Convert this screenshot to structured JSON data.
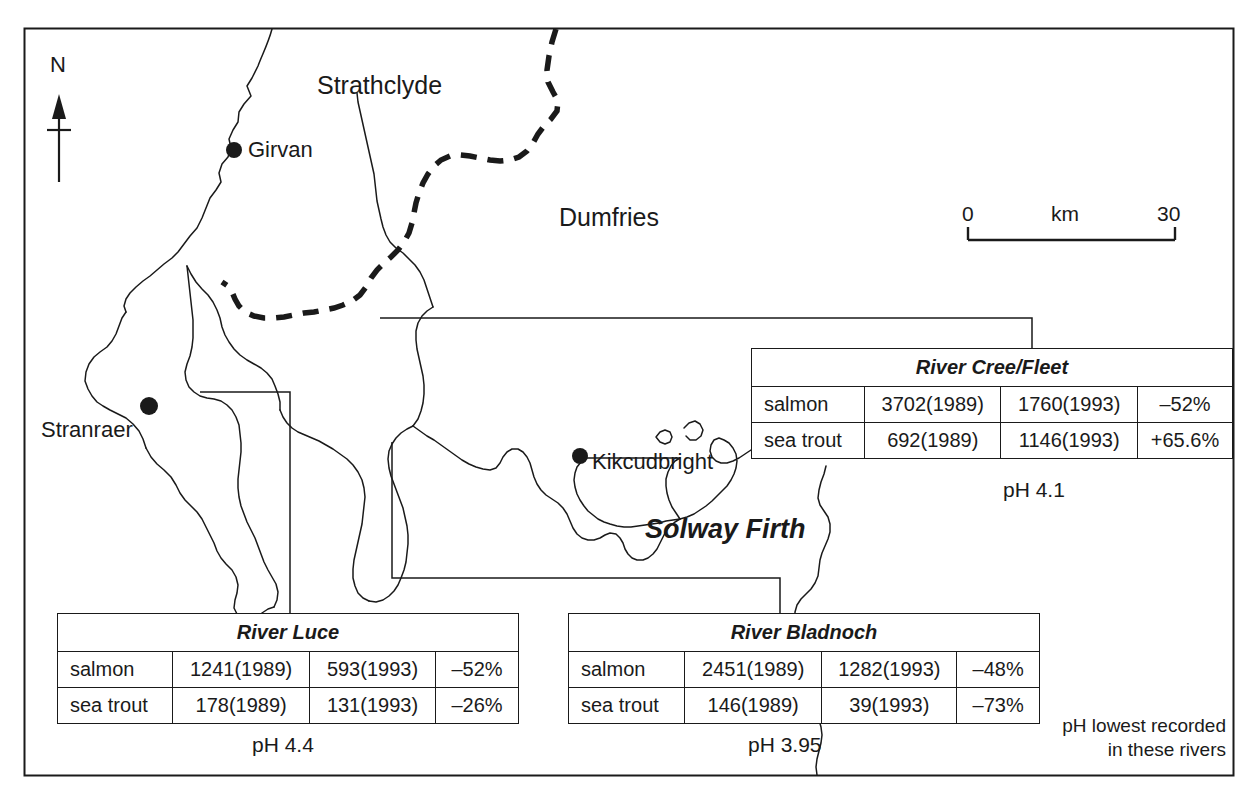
{
  "figure": {
    "frame_color": "#1a1a1a",
    "background": "#ffffff"
  },
  "north_arrow": {
    "label": "N"
  },
  "scale_bar": {
    "left_label": "0",
    "unit_label": "km",
    "right_label": "30"
  },
  "regions": [
    {
      "name": "strathclyde",
      "label": "Strathclyde"
    },
    {
      "name": "dumfries",
      "label": "Dumfries"
    }
  ],
  "water_bodies": [
    {
      "name": "solway-firth",
      "label": "Solway Firth"
    }
  ],
  "towns": [
    {
      "name": "girvan",
      "label": "Girvan"
    },
    {
      "name": "stranraer",
      "label": "Stranraer"
    },
    {
      "name": "kikcudbright",
      "label": "Kikcudbright"
    }
  ],
  "tables": {
    "cree_fleet": {
      "title": "River Cree/Fleet",
      "ph_label": "pH 4.1",
      "rows": [
        {
          "species": "salmon",
          "count_1989": "3702(1989)",
          "count_1993": "1760(1993)",
          "change": "–52%"
        },
        {
          "species": "sea trout",
          "count_1989": "692(1989)",
          "count_1993": "1146(1993)",
          "change": "+65.6%"
        }
      ]
    },
    "luce": {
      "title": "River Luce",
      "ph_label": "pH 4.4",
      "rows": [
        {
          "species": "salmon",
          "count_1989": "1241(1989)",
          "count_1993": "593(1993)",
          "change": "–52%"
        },
        {
          "species": "sea trout",
          "count_1989": "178(1989)",
          "count_1993": "131(1993)",
          "change": "–26%"
        }
      ]
    },
    "bladnoch": {
      "title": "River Bladnoch",
      "ph_label": "pH 3.95",
      "rows": [
        {
          "species": "salmon",
          "count_1989": "2451(1989)",
          "count_1993": "1282(1993)",
          "change": "–48%"
        },
        {
          "species": "sea trout",
          "count_1989": "146(1989)",
          "count_1993": "39(1993)",
          "change": "–73%"
        }
      ]
    }
  },
  "note": {
    "line1": "pH lowest recorded",
    "line2": "in these rivers"
  }
}
